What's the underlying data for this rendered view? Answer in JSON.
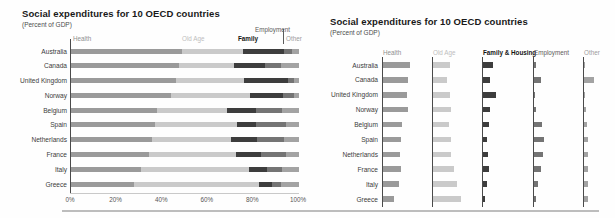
{
  "figure_caption": "Side-by-side comparison of a 100% stacked bar chart and a small-multiples bar chart of the same data",
  "chart_data": [
    {
      "type": "bar",
      "variant": "horizontal-stacked-100pct",
      "title": "Social expenditures for 10 OECD countries",
      "subtitle": "(Percent of GDP)",
      "categories": [
        "Australia",
        "Canada",
        "United Kingdom",
        "Norway",
        "Belgium",
        "Spain",
        "Netherlands",
        "France",
        "Italy",
        "Greece"
      ],
      "series": [
        {
          "name": "Health",
          "values": [
            48.5,
            47.5,
            46,
            44,
            37.5,
            37,
            35.5,
            34,
            30.5,
            27.5
          ]
        },
        {
          "name": "Old Age",
          "values": [
            27,
            24,
            30,
            34.5,
            31,
            36,
            34.5,
            38.5,
            47.5,
            55
          ]
        },
        {
          "name": "Family",
          "values": [
            18,
            13.5,
            19,
            14.5,
            12.5,
            8,
            11.5,
            11,
            8,
            5.5
          ]
        },
        {
          "name": "Employment",
          "values": [
            3.5,
            7,
            3,
            5,
            11.5,
            13.5,
            12,
            11,
            6.5,
            4
          ]
        },
        {
          "name": "Other",
          "values": [
            3,
            8,
            2,
            2,
            7.5,
            5.5,
            6.5,
            5.5,
            7.5,
            8
          ]
        }
      ],
      "x_ticks": [
        "0%",
        "20%",
        "40%",
        "60%",
        "80%",
        "100%"
      ],
      "xlim": [
        0,
        100
      ],
      "legend_position": "top",
      "grid": false
    },
    {
      "type": "bar",
      "variant": "horizontal-small-multiples",
      "title": "Social expenditures for 10 OECD countries",
      "subtitle": "(Percent of GDP)",
      "categories": [
        "Australia",
        "Canada",
        "United Kingdom",
        "Norway",
        "Belgium",
        "Spain",
        "Netherlands",
        "France",
        "Italy",
        "Greece"
      ],
      "panels": [
        {
          "name": "Health",
          "values": [
            8.9,
            8.2,
            8.0,
            8.2,
            6.3,
            6.0,
            5.6,
            6.0,
            5.2,
            3.8
          ]
        },
        {
          "name": "Old Age",
          "values": [
            5.6,
            4.8,
            5.6,
            5.9,
            5.2,
            5.9,
            6.1,
            7.0,
            8.1,
            9.4
          ]
        },
        {
          "name": "Family & Housing",
          "values": [
            3.3,
            2.2,
            4.3,
            2.3,
            2.0,
            1.3,
            1.7,
            2.0,
            1.3,
            0.8
          ]
        },
        {
          "name": "Employment",
          "values": [
            0.7,
            2.3,
            0.3,
            0.7,
            2.7,
            3.3,
            3.0,
            2.3,
            1.3,
            0.8
          ]
        },
        {
          "name": "Other",
          "values": [
            0.3,
            3.3,
            0.3,
            0.5,
            1.0,
            1.3,
            1.3,
            1.3,
            1.3,
            1.3
          ]
        }
      ],
      "unit": "percent of GDP (estimated, no numeric axis shown)",
      "axis_shown": false,
      "grid": false
    }
  ],
  "colors": {
    "health": "#9a9a9a",
    "old_age": "#cacaca",
    "family": "#3d3d3d",
    "employment": "#747474",
    "other": "#a3a3a3",
    "header_health": "#8f8f8f",
    "header_old_age": "#bdbdbd",
    "header_family": "#141414",
    "header_employment": "#5c5c5c",
    "header_other": "#9c9c9c",
    "axis_line": "#4a4a4a",
    "light_line": "#c9c9c9",
    "divider": "#bdbdbd"
  }
}
